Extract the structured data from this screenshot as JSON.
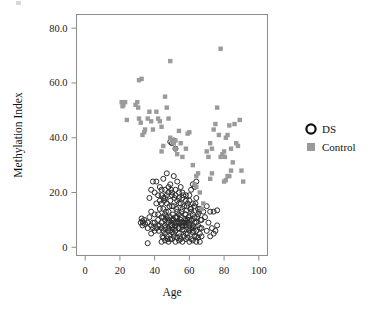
{
  "chart_data": {
    "type": "scatter",
    "title": "",
    "xlabel": "Age",
    "ylabel": "Methylation Index",
    "xlim": [
      -5,
      105
    ],
    "ylim": [
      -3,
      85
    ],
    "grid": false,
    "legend_position": "right",
    "xticks": [
      0,
      20,
      40,
      60,
      80,
      100
    ],
    "xticklabels": [
      "0",
      "20",
      "40",
      "60",
      "80",
      "100"
    ],
    "yticks": [
      0,
      20,
      40,
      60,
      80
    ],
    "yticklabels": [
      "0",
      "20.0",
      "40.0",
      "60.0",
      "80.0"
    ],
    "series": [
      {
        "name": "DS",
        "marker": "open-circle",
        "color": "#2b2b2b",
        "points": [
          [
            33,
            9.5
          ],
          [
            33.5,
            9
          ],
          [
            34,
            10
          ],
          [
            32,
            9
          ],
          [
            33,
            8
          ],
          [
            34.5,
            8.5
          ],
          [
            32.5,
            10.5
          ],
          [
            36,
            1.5
          ],
          [
            38,
            5
          ],
          [
            39,
            7
          ],
          [
            40,
            12
          ],
          [
            41,
            16
          ],
          [
            42,
            10
          ],
          [
            42.5,
            6
          ],
          [
            43,
            14
          ],
          [
            44,
            9
          ],
          [
            44.5,
            4
          ],
          [
            45,
            11
          ],
          [
            45.5,
            17
          ],
          [
            46,
            7
          ],
          [
            46.5,
            13
          ],
          [
            47,
            19
          ],
          [
            47.5,
            3
          ],
          [
            48,
            10
          ],
          [
            48.5,
            15
          ],
          [
            49,
            6
          ],
          [
            49.5,
            21
          ],
          [
            50,
            8
          ],
          [
            50.5,
            12
          ],
          [
            51,
            5
          ],
          [
            51.5,
            18
          ],
          [
            52,
            9
          ],
          [
            52.5,
            14
          ],
          [
            53,
            11
          ],
          [
            53.5,
            7
          ],
          [
            54,
            16
          ],
          [
            54.5,
            4
          ],
          [
            55,
            10
          ],
          [
            55.5,
            13
          ],
          [
            56,
            8
          ],
          [
            56.5,
            19
          ],
          [
            57,
            6
          ],
          [
            57.5,
            12
          ],
          [
            58,
            9
          ],
          [
            58.5,
            15
          ],
          [
            59,
            5
          ],
          [
            59.5,
            11
          ],
          [
            60,
            8
          ],
          [
            60.5,
            14
          ],
          [
            61,
            7
          ],
          [
            61.5,
            10
          ],
          [
            62,
            12
          ],
          [
            62.5,
            6
          ],
          [
            63,
            9
          ],
          [
            63.5,
            16
          ],
          [
            64,
            4
          ],
          [
            64.5,
            11
          ],
          [
            65,
            8
          ],
          [
            65.5,
            13
          ],
          [
            66,
            5
          ],
          [
            66.5,
            10
          ],
          [
            67,
            7
          ],
          [
            41,
            24
          ],
          [
            43,
            22
          ],
          [
            45,
            25
          ],
          [
            47,
            27
          ],
          [
            49,
            23
          ],
          [
            51,
            26
          ],
          [
            53,
            24
          ],
          [
            55,
            22
          ],
          [
            40,
            20
          ],
          [
            42,
            19
          ],
          [
            44,
            21
          ],
          [
            46,
            18
          ],
          [
            48,
            20
          ],
          [
            50,
            19
          ],
          [
            52,
            21
          ],
          [
            54,
            18
          ],
          [
            56,
            20
          ],
          [
            58,
            17
          ],
          [
            60,
            19
          ],
          [
            62,
            16
          ],
          [
            64,
            18
          ],
          [
            66,
            14
          ],
          [
            68,
            13
          ],
          [
            70,
            15
          ],
          [
            72,
            13
          ],
          [
            74,
            13
          ],
          [
            76,
            13.5
          ],
          [
            71,
            9
          ],
          [
            73,
            7
          ],
          [
            75,
            6
          ],
          [
            69,
            11
          ],
          [
            67,
            10
          ],
          [
            36,
            9
          ],
          [
            37,
            11
          ],
          [
            38,
            13
          ],
          [
            39,
            9
          ],
          [
            40,
            6
          ],
          [
            41,
            7
          ],
          [
            42,
            12
          ],
          [
            43,
            8
          ],
          [
            44,
            16
          ],
          [
            45,
            14
          ],
          [
            46,
            10
          ],
          [
            47,
            9
          ],
          [
            48,
            13
          ],
          [
            49,
            11
          ],
          [
            50,
            15
          ],
          [
            51,
            9
          ],
          [
            52,
            7
          ],
          [
            53,
            13
          ],
          [
            54,
            9
          ],
          [
            55,
            11
          ],
          [
            56,
            14
          ],
          [
            57,
            8
          ],
          [
            58,
            12
          ],
          [
            59,
            9
          ],
          [
            60,
            10
          ],
          [
            61,
            13
          ],
          [
            62,
            8
          ],
          [
            63,
            11
          ],
          [
            64,
            9
          ],
          [
            65,
            12
          ],
          [
            66,
            7
          ],
          [
            67,
            4
          ],
          [
            44,
            2
          ],
          [
            46,
            2.5
          ],
          [
            48,
            2
          ],
          [
            50,
            3
          ],
          [
            52,
            2
          ],
          [
            54,
            2.5
          ],
          [
            56,
            2
          ],
          [
            58,
            3
          ],
          [
            60,
            2
          ],
          [
            62,
            2.5
          ],
          [
            64,
            2
          ],
          [
            66,
            2
          ],
          [
            45,
            3.5
          ],
          [
            47,
            4
          ],
          [
            49,
            3
          ],
          [
            51,
            4
          ],
          [
            53,
            3.5
          ],
          [
            55,
            3
          ],
          [
            57,
            4
          ],
          [
            59,
            3.5
          ],
          [
            61,
            3
          ],
          [
            63,
            4
          ],
          [
            65,
            3.5
          ],
          [
            46,
            5
          ],
          [
            48,
            6
          ],
          [
            50,
            5.5
          ],
          [
            52,
            6
          ],
          [
            54,
            5
          ],
          [
            56,
            6.5
          ],
          [
            58,
            5
          ],
          [
            60,
            6
          ],
          [
            62,
            5.5
          ],
          [
            64,
            6
          ],
          [
            43,
            17
          ],
          [
            45,
            18
          ],
          [
            47,
            16
          ],
          [
            49,
            17
          ],
          [
            51,
            15
          ],
          [
            53,
            17
          ],
          [
            55,
            16
          ],
          [
            57,
            15
          ],
          [
            59,
            16
          ],
          [
            61,
            14
          ],
          [
            63,
            15
          ],
          [
            65,
            14
          ],
          [
            50,
            38
          ],
          [
            51,
            39
          ],
          [
            52,
            36
          ],
          [
            49,
            38.5
          ],
          [
            39,
            24
          ],
          [
            38,
            21
          ],
          [
            37,
            18
          ],
          [
            62,
            23
          ],
          [
            63,
            22
          ],
          [
            64,
            24
          ],
          [
            61,
            21
          ],
          [
            70,
            6
          ],
          [
            72,
            4
          ],
          [
            74,
            5
          ],
          [
            76,
            8
          ],
          [
            44,
            11
          ],
          [
            46,
            12
          ],
          [
            48,
            9
          ],
          [
            50,
            10
          ],
          [
            52,
            11
          ],
          [
            54,
            12
          ],
          [
            56,
            9
          ],
          [
            58,
            10
          ],
          [
            42,
            8
          ],
          [
            40,
            9
          ],
          [
            38,
            8
          ],
          [
            36,
            7
          ],
          [
            44,
            7
          ],
          [
            46,
            8
          ],
          [
            48,
            7
          ],
          [
            50,
            7
          ],
          [
            52,
            8
          ],
          [
            54,
            7
          ],
          [
            56,
            7.5
          ],
          [
            58,
            8
          ],
          [
            60,
            7
          ],
          [
            62,
            7
          ],
          [
            44,
            19
          ],
          [
            46,
            21
          ],
          [
            48,
            22
          ],
          [
            50,
            20
          ],
          [
            52,
            19
          ],
          [
            54,
            20
          ],
          [
            56,
            18
          ],
          [
            58,
            19
          ],
          [
            60,
            17
          ],
          [
            53,
            9
          ],
          [
            55,
            9
          ],
          [
            57,
            9
          ],
          [
            59,
            10
          ],
          [
            51,
            10
          ],
          [
            49,
            8
          ],
          [
            47,
            11
          ],
          [
            45,
            6
          ]
        ]
      },
      {
        "name": "Control",
        "marker": "filled-square",
        "color": "#9a9a9a",
        "points": [
          [
            21,
            53
          ],
          [
            21.5,
            51.5
          ],
          [
            22,
            52
          ],
          [
            24,
            46.5
          ],
          [
            23,
            53
          ],
          [
            29,
            52
          ],
          [
            30,
            53
          ],
          [
            30.5,
            51
          ],
          [
            31,
            47
          ],
          [
            32,
            45.5
          ],
          [
            33,
            41
          ],
          [
            34,
            42
          ],
          [
            34.5,
            43
          ],
          [
            36,
            47
          ],
          [
            37,
            49.5
          ],
          [
            38,
            46
          ],
          [
            39,
            43
          ],
          [
            41,
            49.5
          ],
          [
            42,
            47
          ],
          [
            43,
            46
          ],
          [
            44,
            44
          ],
          [
            46,
            55
          ],
          [
            47,
            51
          ],
          [
            48,
            47
          ],
          [
            49,
            40
          ],
          [
            50,
            39
          ],
          [
            50.5,
            38.5
          ],
          [
            51,
            38
          ],
          [
            52,
            39
          ],
          [
            54,
            42.5
          ],
          [
            55,
            38
          ],
          [
            56,
            33
          ],
          [
            58,
            36
          ],
          [
            59,
            41.5
          ],
          [
            60,
            42
          ],
          [
            31,
            61
          ],
          [
            32.5,
            61.5
          ],
          [
            49,
            68
          ],
          [
            78,
            72.5
          ],
          [
            62,
            30
          ],
          [
            64,
            26
          ],
          [
            65,
            27
          ],
          [
            70,
            35
          ],
          [
            71,
            33
          ],
          [
            72,
            38
          ],
          [
            73,
            36
          ],
          [
            74,
            43
          ],
          [
            75,
            45
          ],
          [
            76,
            51
          ],
          [
            77,
            41
          ],
          [
            78,
            33
          ],
          [
            79,
            34
          ],
          [
            80,
            35
          ],
          [
            80.5,
            33
          ],
          [
            81,
            40
          ],
          [
            82,
            41
          ],
          [
            83,
            44.5
          ],
          [
            84,
            36
          ],
          [
            85,
            31
          ],
          [
            86,
            45
          ],
          [
            87,
            38
          ],
          [
            88,
            37
          ],
          [
            89,
            46.5
          ],
          [
            90,
            28
          ],
          [
            91,
            24
          ],
          [
            72,
            25
          ],
          [
            73,
            27
          ],
          [
            80,
            24
          ],
          [
            81,
            24.5
          ],
          [
            82,
            26
          ],
          [
            83,
            26
          ],
          [
            84,
            28
          ],
          [
            63,
            23
          ],
          [
            64,
            22
          ],
          [
            66,
            20
          ],
          [
            67,
            14
          ],
          [
            68,
            16
          ],
          [
            44,
            35
          ],
          [
            45,
            37
          ],
          [
            52,
            36
          ],
          [
            53,
            34
          ]
        ]
      }
    ]
  },
  "legend": {
    "items": [
      {
        "label": "DS",
        "marker": "open-circle-icon"
      },
      {
        "label": "Control",
        "marker": "filled-square-icon"
      }
    ]
  },
  "axes": {
    "x_title": "Age",
    "y_title": "Methylation Index"
  }
}
